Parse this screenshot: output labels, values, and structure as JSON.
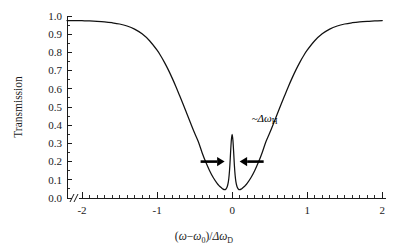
{
  "chart_data": {
    "type": "line",
    "title": "",
    "xlabel": "(ω−ω₀)/Δω_D",
    "ylabel": "Transmission",
    "xlim": [
      -2.2,
      2.05
    ],
    "ylim": [
      0.0,
      1.0
    ],
    "grid": false,
    "legend_position": "none",
    "axis_break_x": true,
    "curve_color": "#111111",
    "xticks": [
      -2,
      -1,
      0,
      1,
      2
    ],
    "xtick_labels": [
      "-2",
      "-1",
      "0",
      "1",
      "2"
    ],
    "x_minor_tick_step": 0.1,
    "yticks": [
      0.0,
      0.1,
      0.2,
      0.3,
      0.4,
      0.5,
      0.6,
      0.7,
      0.8,
      0.9,
      1.0
    ],
    "ytick_labels": [
      "0.0",
      "0.1",
      "0.2",
      "0.3",
      "0.4",
      "0.5",
      "0.6",
      "0.7",
      "0.8",
      "0.9",
      "1.0"
    ],
    "y_minor_tick_step": 0.05,
    "baseline_transmission": 0.975,
    "dip_minimum": 0.033,
    "peak_height": 0.35,
    "doppler_width_hwhm": 0.83,
    "lamb_dip_hwhm": 0.045,
    "series": [
      {
        "name": "Transmission",
        "x": [
          -2.2,
          -2.1,
          -2.0,
          -1.9,
          -1.8,
          -1.7,
          -1.6,
          -1.5,
          -1.4,
          -1.3,
          -1.2,
          -1.1,
          -1.0,
          -0.95,
          -0.9,
          -0.85,
          -0.8,
          -0.75,
          -0.7,
          -0.65,
          -0.6,
          -0.55,
          -0.5,
          -0.45,
          -0.4,
          -0.35,
          -0.3,
          -0.25,
          -0.2,
          -0.17,
          -0.14,
          -0.12,
          -0.1,
          -0.085,
          -0.07,
          -0.06,
          -0.05,
          -0.04,
          -0.03,
          -0.02,
          -0.01,
          0.0,
          0.01,
          0.02,
          0.03,
          0.04,
          0.05,
          0.06,
          0.07,
          0.085,
          0.1,
          0.12,
          0.14,
          0.17,
          0.2,
          0.25,
          0.3,
          0.35,
          0.4,
          0.45,
          0.5,
          0.55,
          0.6,
          0.65,
          0.7,
          0.75,
          0.8,
          0.85,
          0.9,
          0.95,
          1.0,
          1.1,
          1.2,
          1.3,
          1.4,
          1.5,
          1.6,
          1.7,
          1.8,
          1.9,
          2.0
        ],
        "y": [
          0.975,
          0.975,
          0.974,
          0.973,
          0.971,
          0.968,
          0.963,
          0.956,
          0.945,
          0.928,
          0.902,
          0.864,
          0.812,
          0.78,
          0.744,
          0.704,
          0.66,
          0.613,
          0.563,
          0.512,
          0.46,
          0.408,
          0.357,
          0.309,
          0.249,
          0.196,
          0.15,
          0.111,
          0.08,
          0.066,
          0.055,
          0.049,
          0.046,
          0.048,
          0.058,
          0.07,
          0.09,
          0.125,
          0.18,
          0.255,
          0.32,
          0.35,
          0.32,
          0.255,
          0.18,
          0.125,
          0.09,
          0.07,
          0.058,
          0.048,
          0.046,
          0.049,
          0.055,
          0.066,
          0.08,
          0.111,
          0.15,
          0.196,
          0.249,
          0.309,
          0.357,
          0.408,
          0.46,
          0.512,
          0.563,
          0.613,
          0.66,
          0.704,
          0.744,
          0.78,
          0.812,
          0.864,
          0.902,
          0.928,
          0.945,
          0.956,
          0.963,
          0.968,
          0.971,
          0.973,
          0.975
        ]
      }
    ],
    "annotations": [
      {
        "id": "linewidth-annotation",
        "text": "~Δω",
        "subscript": "H",
        "x": 0.26,
        "y": 0.42,
        "arrows": [
          {
            "id": "left-arrow",
            "from_x": -0.42,
            "to_x": -0.1,
            "y": 0.2,
            "direction": "right"
          },
          {
            "id": "right-arrow",
            "from_x": 0.42,
            "to_x": 0.1,
            "y": 0.2,
            "direction": "left"
          }
        ]
      }
    ]
  },
  "axis": {
    "ylabel": "Transmission",
    "xlabel_parts": {
      "open_paren": "(",
      "omega": "ω",
      "minus": "−",
      "omega0_sym": "ω",
      "omega0_sub": "0",
      "close_paren": ")",
      "slash": "/",
      "delta": "Δ",
      "omega_d_sym": "ω",
      "omega_d_sub": "D"
    }
  },
  "annotation": {
    "tilde": "~",
    "delta": "Δ",
    "omega": "ω",
    "subscript": "H"
  }
}
